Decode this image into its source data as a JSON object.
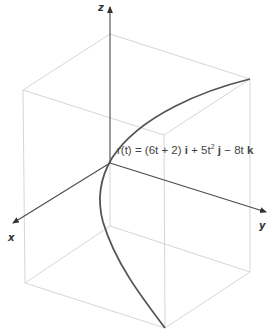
{
  "figure": {
    "type": "3D parametric space curve",
    "axes": {
      "x_label": "x",
      "y_label": "y",
      "z_label": "z"
    },
    "equation": {
      "lhs": "r(t)",
      "equals": "=",
      "term_i": "(6t + 2)",
      "unit_i": "i",
      "plus": "+",
      "term_j_coef": "5t",
      "term_j_exp": "2",
      "unit_j": "j",
      "minus": "−",
      "term_k": "8t",
      "unit_k": "k"
    },
    "colors": {
      "curve": "#555555",
      "axes": "#4a4a4a",
      "box": "#d6d6d6"
    }
  }
}
